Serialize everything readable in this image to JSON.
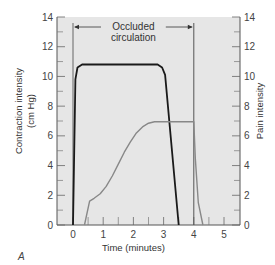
{
  "chart_data": {
    "type": "line",
    "panel_label": "A",
    "xlabel": "Time (minutes)",
    "ylabel_left": [
      "Contraction intensity",
      "(cm Hg)"
    ],
    "ylabel_right": "Pain intensity",
    "xlim": [
      -0.6,
      5.5
    ],
    "ylim": [
      0,
      14
    ],
    "x_ticks": [
      0,
      1,
      2,
      3,
      4,
      5
    ],
    "x_minor_ticks": [
      0.5,
      1.5,
      2.5,
      3.5,
      4.5
    ],
    "y_ticks": [
      0,
      2,
      4,
      6,
      8,
      10,
      12,
      14
    ],
    "y_minor_ticks": [
      1,
      3,
      5,
      7,
      9,
      11,
      13
    ],
    "background_color": "#e6e6e6",
    "annotation": {
      "lines": [
        "Occluded",
        "circulation"
      ],
      "start": 0,
      "end": 4
    },
    "series": [
      {
        "name": "Contraction intensity",
        "color": "#1a1a1a",
        "x": [
          0,
          0.08,
          0.15,
          0.3,
          1,
          2,
          2.8,
          2.95,
          3.05,
          3.5
        ],
        "y": [
          0,
          9.8,
          10.6,
          10.8,
          10.8,
          10.8,
          10.8,
          10.6,
          10.1,
          0
        ]
      },
      {
        "name": "Pain intensity",
        "color": "#888888",
        "x": [
          0.38,
          0.55,
          0.7,
          0.9,
          1.1,
          1.3,
          1.5,
          1.7,
          1.9,
          2.1,
          2.3,
          2.5,
          2.7,
          3,
          3.5,
          4,
          4.05,
          4.15,
          4.3
        ],
        "y": [
          0,
          1.6,
          1.8,
          2.1,
          2.6,
          3.3,
          4.1,
          4.9,
          5.6,
          6.2,
          6.6,
          6.85,
          6.95,
          6.95,
          6.95,
          6.95,
          4.5,
          1.5,
          0
        ]
      }
    ]
  }
}
